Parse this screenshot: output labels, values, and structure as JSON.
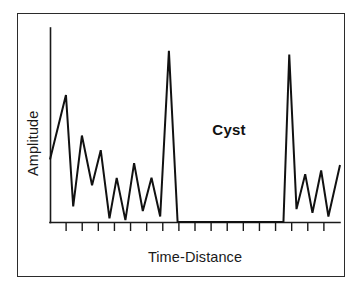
{
  "figure": {
    "background_color": "#ffffff",
    "frame_color": "#2b2b2b",
    "trace_color": "#111111",
    "axis_color": "#1a1a1a"
  },
  "annotations": {
    "cyst_label": "Cyst"
  },
  "chart_data": {
    "type": "line",
    "title": "",
    "subtitle": "",
    "xlabel": "Time-Distance",
    "ylabel": "Amplitude",
    "grid": false,
    "legend": null,
    "legend_position": "none",
    "axis_tick_labels": {
      "x": [],
      "y": []
    },
    "xlim": [
      0,
      100
    ],
    "ylim": [
      0,
      100
    ],
    "x_tick_count": 17,
    "annotations": [
      {
        "text": "Cyst",
        "x": 61,
        "y": 48,
        "bold": true,
        "note": "anechoic flat-baseline region between the two specular peaks"
      }
    ],
    "series": [
      {
        "name": "A-mode echo amplitude",
        "color": "#111111",
        "x": [
          0.0,
          5.5,
          8.0,
          11.0,
          14.5,
          17.5,
          20.5,
          23.0,
          26.0,
          29.0,
          32.0,
          35.0,
          38.0,
          41.0,
          44.0,
          47.0,
          50.0,
          52.5,
          55.0,
          58.0,
          59.5,
          62.5,
          65.5,
          68.0,
          70.0,
          72.0,
          75.0,
          78.0,
          80.5,
          82.5,
          85.0,
          88.0,
          90.5,
          93.5,
          96.0,
          100.0
        ],
        "values": [
          34.0,
          69.0,
          8.5,
          47.0,
          20.0,
          39.0,
          2.0,
          24.0,
          1.0,
          32.0,
          6.0,
          24.0,
          3.0,
          93.0,
          0.0,
          0.0,
          0.0,
          0.0,
          0.0,
          0.0,
          0.0,
          0.0,
          0.0,
          0.0,
          0.0,
          0.0,
          0.0,
          0.0,
          0.0,
          91.0,
          7.0,
          26.0,
          5.0,
          28.0,
          3.0,
          31.0
        ]
      }
    ]
  }
}
